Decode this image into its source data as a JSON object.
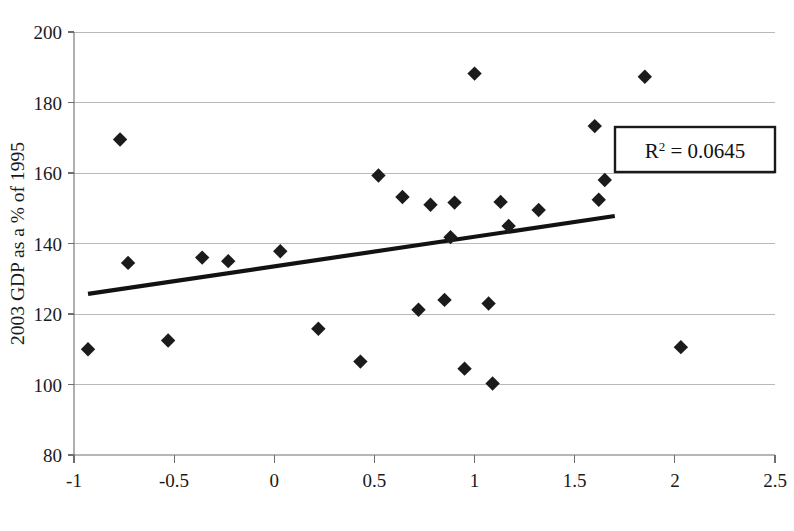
{
  "chart_data": {
    "type": "scatter",
    "title": "",
    "xlabel": "",
    "ylabel": "2003 GDP as a % of 1995",
    "xlim": [
      -1,
      2.5
    ],
    "ylim": [
      80,
      200
    ],
    "xticks": [
      -1,
      -0.5,
      0,
      0.5,
      1,
      1.5,
      2,
      2.5
    ],
    "xtick_labels": [
      "-1",
      "-0.5",
      "0",
      "0.5",
      "1",
      "1.5",
      "2",
      "2.5"
    ],
    "yticks": [
      80,
      100,
      120,
      140,
      160,
      180,
      200
    ],
    "ytick_labels": [
      "80",
      "100",
      "120",
      "140",
      "160",
      "180",
      "200"
    ],
    "grid": "horizontal",
    "legend": "none",
    "marker_shape": "diamond",
    "marker_color": "#1b1b1b",
    "points": [
      {
        "x": -0.93,
        "y": 110.0
      },
      {
        "x": -0.77,
        "y": 169.5
      },
      {
        "x": -0.73,
        "y": 134.5
      },
      {
        "x": -0.53,
        "y": 112.5
      },
      {
        "x": -0.36,
        "y": 136.0
      },
      {
        "x": -0.23,
        "y": 135.0
      },
      {
        "x": 0.03,
        "y": 137.8
      },
      {
        "x": 0.22,
        "y": 115.8
      },
      {
        "x": 0.43,
        "y": 106.5
      },
      {
        "x": 0.52,
        "y": 159.3
      },
      {
        "x": 0.64,
        "y": 153.2
      },
      {
        "x": 0.72,
        "y": 121.2
      },
      {
        "x": 0.78,
        "y": 151.0
      },
      {
        "x": 0.85,
        "y": 124.0
      },
      {
        "x": 0.88,
        "y": 141.8
      },
      {
        "x": 0.9,
        "y": 151.6
      },
      {
        "x": 0.95,
        "y": 104.5
      },
      {
        "x": 1.0,
        "y": 188.2
      },
      {
        "x": 1.07,
        "y": 123.0
      },
      {
        "x": 1.09,
        "y": 100.3
      },
      {
        "x": 1.13,
        "y": 151.8
      },
      {
        "x": 1.17,
        "y": 145.0
      },
      {
        "x": 1.32,
        "y": 149.5
      },
      {
        "x": 1.6,
        "y": 173.3
      },
      {
        "x": 1.62,
        "y": 152.4
      },
      {
        "x": 1.65,
        "y": 158.0
      },
      {
        "x": 1.85,
        "y": 187.3
      },
      {
        "x": 2.03,
        "y": 110.6
      }
    ],
    "trendline": {
      "type": "linear",
      "x_start": -0.93,
      "y_start": 125.7,
      "x_end": 1.7,
      "y_end": 147.8
    },
    "annotations": [
      {
        "name": "r2-annotation",
        "text_prefix": "R",
        "text_superscript": "2",
        "text_suffix": " = 0.0645",
        "full_text": "R² = 0.0645",
        "boxed": true
      }
    ]
  }
}
